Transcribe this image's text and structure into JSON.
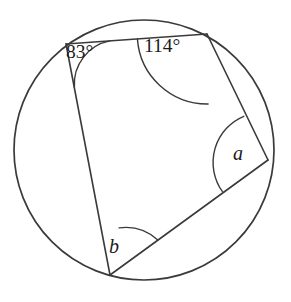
{
  "figure": {
    "shape": "circle-with-inscribed-quadrilateral",
    "stroke_color": "#3a3a3a",
    "text_color": "#1b1b1b",
    "background_color": "#ffffff",
    "circle": {
      "center_x": 144,
      "center_y": 150,
      "radius": 130
    },
    "vertices": [
      {
        "id": "A",
        "name": "top-left-vertex",
        "x": 66,
        "y": 44
      },
      {
        "id": "B",
        "name": "top-right-vertex",
        "x": 207,
        "y": 34
      },
      {
        "id": "C",
        "name": "right-vertex",
        "x": 268,
        "y": 160
      },
      {
        "id": "D",
        "name": "bottom-vertex",
        "x": 110,
        "y": 275
      }
    ],
    "chords": [
      {
        "name": "chord-top",
        "from": "A",
        "to": "B"
      },
      {
        "name": "chord-right",
        "from": "B",
        "to": "C"
      },
      {
        "name": "chord-bottom",
        "from": "C",
        "to": "D"
      },
      {
        "name": "chord-left",
        "from": "D",
        "to": "A"
      }
    ],
    "angles": [
      {
        "id": "angle-83",
        "vertex": "A",
        "label": "83°",
        "value": 83,
        "unit": "degrees",
        "known": true,
        "arc_radius": 44
      },
      {
        "id": "angle-114",
        "vertex": "B",
        "label": "114°",
        "value": 114,
        "unit": "degrees",
        "known": true,
        "arc_radius": 70
      },
      {
        "id": "angle-a",
        "vertex": "C",
        "label": "a",
        "value": null,
        "unit": "degrees",
        "known": false,
        "arc_radius": 50
      },
      {
        "id": "angle-b",
        "vertex": "D",
        "label": "b",
        "value": null,
        "unit": "degrees",
        "known": false,
        "arc_radius": 48
      }
    ]
  }
}
